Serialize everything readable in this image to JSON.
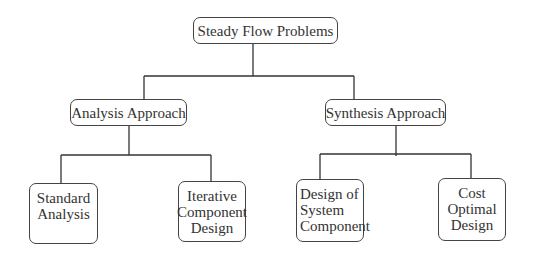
{
  "diagram": {
    "type": "hierarchy",
    "root": {
      "label": "Steady Flow Problems"
    },
    "level1": [
      {
        "label": "Analysis Approach"
      },
      {
        "label": "Synthesis Approach"
      }
    ],
    "level2": {
      "analysis": [
        {
          "lines": [
            "Standard",
            "Analysis"
          ]
        },
        {
          "lines": [
            "Iterative",
            "Component",
            "Design"
          ]
        }
      ],
      "synthesis": [
        {
          "lines": [
            "Design of",
            "System",
            "Component"
          ]
        },
        {
          "lines": [
            "Cost",
            "Optimal",
            "Design"
          ]
        }
      ]
    },
    "edges": [
      [
        "Steady Flow Problems",
        "Analysis Approach"
      ],
      [
        "Steady Flow Problems",
        "Synthesis Approach"
      ],
      [
        "Analysis Approach",
        "Standard Analysis"
      ],
      [
        "Analysis Approach",
        "Iterative Component Design"
      ],
      [
        "Synthesis Approach",
        "Design of System Component"
      ],
      [
        "Synthesis Approach",
        "Cost Optimal Design"
      ]
    ],
    "line_color": "#333333"
  }
}
